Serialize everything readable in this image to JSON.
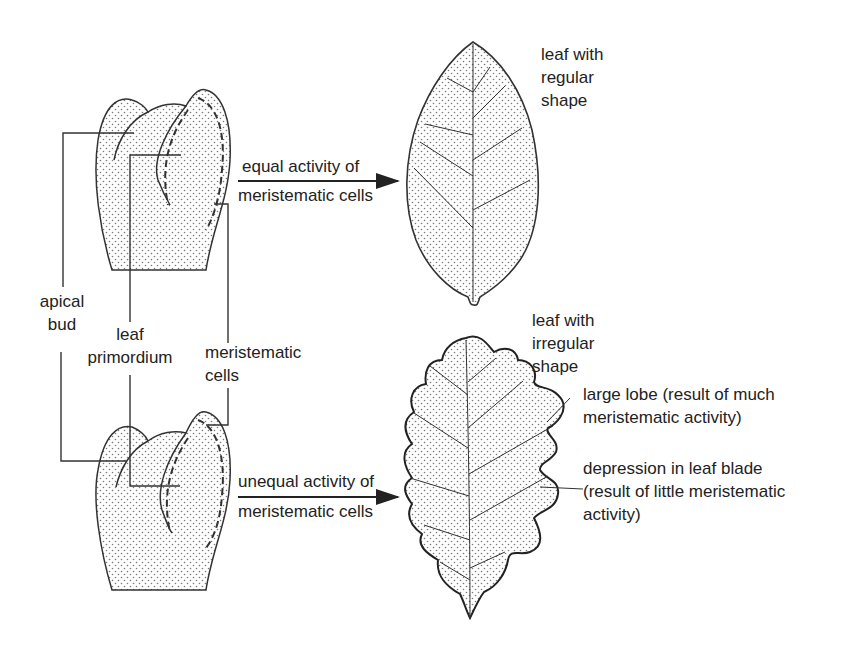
{
  "diagram": {
    "title_hint": "Leaf shape determined by meristematic cell activity",
    "colors": {
      "line": "#333333",
      "fill_dots": "#777777",
      "background": "#ffffff"
    },
    "labels": {
      "apical_bud": [
        "apical",
        "bud"
      ],
      "leaf_primordium": [
        "leaf",
        "primordium"
      ],
      "meristematic_cells": [
        "meristematic",
        "cells"
      ],
      "equal_arrow": [
        "equal activity of",
        "meristematic cells"
      ],
      "unequal_arrow": [
        "unequal activity of",
        "meristematic cells"
      ],
      "regular_leaf": [
        "leaf with",
        "regular",
        "shape"
      ],
      "irregular_leaf": [
        "leaf with",
        "irregular",
        "shape"
      ],
      "large_lobe": [
        "large lobe (result of much",
        "meristematic activity)"
      ],
      "depression": [
        "depression in leaf blade",
        "(result of little meristematic",
        "activity)"
      ]
    },
    "icons": [
      "apical-bud-drawing",
      "regular-leaf-drawing",
      "oak-leaf-drawing",
      "arrow-right"
    ]
  }
}
